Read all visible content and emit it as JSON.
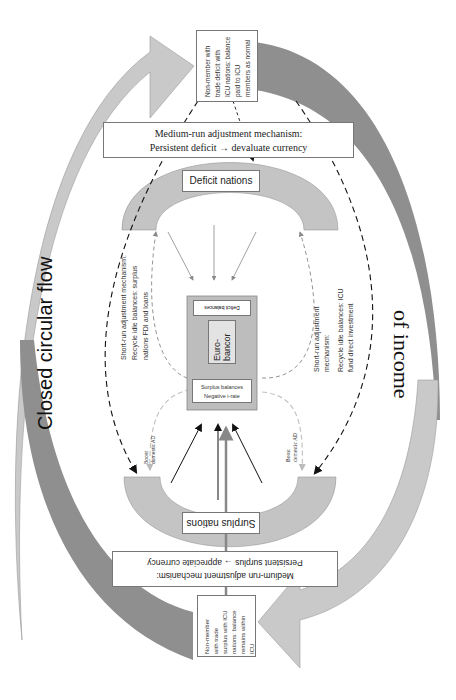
{
  "diagram": {
    "title_left": "Closed circular flow",
    "title_right": "of income",
    "top_box": {
      "lines": [
        "Non-member with",
        "trade deficit with",
        "ICU nations: balance",
        "paid to ICU",
        "members as normal"
      ]
    },
    "bottom_box": {
      "lines": [
        "Non-member",
        "with trade",
        "surplus with ICU",
        "nations: balance",
        "remains within",
        "ICU"
      ]
    },
    "medium_run_top": {
      "line1": "Medium-run adjustment mechanism:",
      "line2": "Persistent deficit → devaluate currency"
    },
    "medium_run_bottom": {
      "line1": "Medium-run adjustment mechanism:",
      "line2": "Persistent surplus → appreciate currency"
    },
    "deficit_nations": "Deficit nations",
    "surplus_nations": "Surplus nations",
    "center": {
      "deficit_balances": "Deficit balances",
      "eurobancor_line1": "Euro-",
      "eurobancor_line2": "bancor",
      "surplus_line1": "Surplus balances",
      "surplus_line2": "Negative i-rate"
    },
    "short_run_left": {
      "line1": "Short-run adjustment mechanism:",
      "line2": "Recycle idle balances: surplus",
      "line3": "nations FDI and loans"
    },
    "short_run_right": {
      "line1": "Short-run adjustment",
      "line2": "mechanism:",
      "line3": "Recycle idle balances: ICU",
      "line4": "fund direct investment"
    },
    "boost_left": {
      "line1": "Boost",
      "line2": "domestic AD"
    },
    "boost_right": {
      "line1": "Boost",
      "line2": "domestic AD"
    },
    "colors": {
      "light_arrow": "#c8c8c8",
      "dark_arrow": "#8f8f8f",
      "arc_fill": "#c4c4c4",
      "center_fill": "#bdbdbd",
      "border": "#777777"
    }
  }
}
